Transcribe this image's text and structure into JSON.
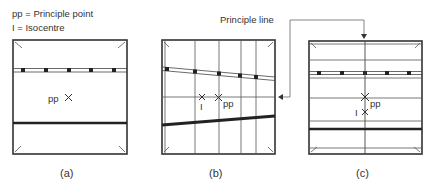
{
  "legend": {
    "line1": "pp = Principle point",
    "line2": "I = Isocentre"
  },
  "annotation": {
    "principle_line": "Principle line"
  },
  "panels": [
    {
      "id": "a",
      "caption": "(a)",
      "pp_label": "pp"
    },
    {
      "id": "b",
      "caption": "(b)",
      "pp_label": "pp",
      "i_label": "I"
    },
    {
      "id": "c",
      "caption": "(c)",
      "pp_label": "pp",
      "i_label": "I"
    }
  ],
  "colors": {
    "ink": "#333333",
    "thin_line": "#555555",
    "background": "#ffffff"
  }
}
